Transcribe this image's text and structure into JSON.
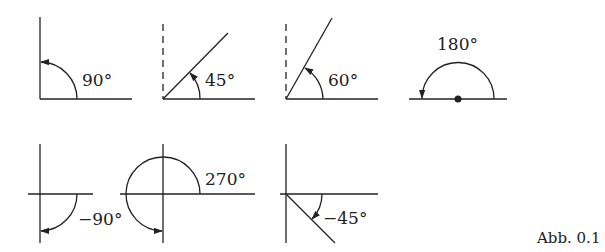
{
  "figure": {
    "caption": "Abb. 0.1",
    "angles": [
      {
        "id": "a90",
        "label": "90°",
        "degrees": 90,
        "direction": "counterclockwise"
      },
      {
        "id": "a45",
        "label": "45°",
        "degrees": 45,
        "direction": "counterclockwise"
      },
      {
        "id": "a60",
        "label": "60°",
        "degrees": 60,
        "direction": "counterclockwise"
      },
      {
        "id": "a180",
        "label": "180°",
        "degrees": 180,
        "direction": "counterclockwise"
      },
      {
        "id": "am90",
        "label": "−90°",
        "degrees": -90,
        "direction": "clockwise"
      },
      {
        "id": "a270",
        "label": "270°",
        "degrees": 270,
        "direction": "counterclockwise"
      },
      {
        "id": "am45",
        "label": "−45°",
        "degrees": -45,
        "direction": "clockwise"
      }
    ]
  },
  "colors": {
    "ink": "#222222",
    "background": "#ffffff"
  }
}
